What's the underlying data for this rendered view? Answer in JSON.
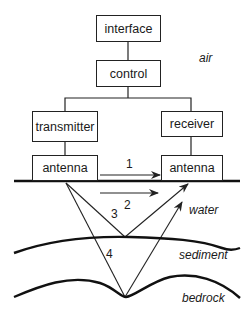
{
  "diagram": {
    "title": "",
    "boxes": {
      "interface": "interface",
      "control": "control",
      "transmitter": "transmitter",
      "receiver": "receiver",
      "antenna_tx": "antenna",
      "antenna_rx": "antenna"
    },
    "path_labels": [
      "1",
      "2",
      "3",
      "4"
    ],
    "layers": {
      "air": "air",
      "water": "water",
      "sediment": "sediment",
      "bedrock": "bedrock"
    }
  }
}
